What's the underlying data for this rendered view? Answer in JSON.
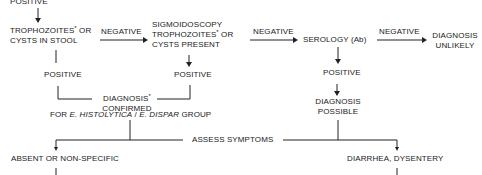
{
  "nodes": {
    "top_positive": "POSITIVE",
    "stool": {
      "line1": "TROPHOZOITES",
      "mark": "*",
      "line1_tail": " OR",
      "line2": "CYSTS IN STOOL"
    },
    "stool_negative": "NEGATIVE",
    "sigmoid": {
      "line1": "SIGMOIDOSCOPY",
      "line2": "TROPHOZOITES",
      "mark": "*",
      "line2_tail": " OR",
      "line3": "CYSTS PRESENT"
    },
    "sigmoid_negative": "NEGATIVE",
    "serology": "SEROLOGY (Ab)",
    "serology_negative": "NEGATIVE",
    "unlikely": {
      "line1": "DIAGNOSIS",
      "line2": "UNLIKELY"
    },
    "stool_positive": "POSITIVE",
    "sigmoid_positive": "POSITIVE",
    "serology_positive": "POSITIVE",
    "confirmed": {
      "line1": "DIAGNOSIS",
      "mark": "*",
      "line2": "CONFIRMED"
    },
    "group": {
      "pre": "FOR ",
      "org1": "E. HISTOLYTICA",
      "sep": " / ",
      "org2": "E. DISPAR",
      "post": " GROUP"
    },
    "possible": {
      "line1": "DIAGNOSIS",
      "line2": "POSSIBLE"
    },
    "assess": "ASSESS SYMPTOMS",
    "absent": "ABSENT OR NON-SPECIFIC",
    "diarrhea": "DIARRHEA, DYSENTERY"
  }
}
